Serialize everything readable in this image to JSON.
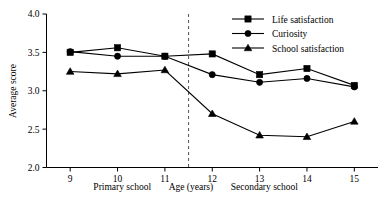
{
  "chart_data": {
    "type": "line",
    "title": "",
    "xlabel": "Age (years)",
    "ylabel": "Average score",
    "x": [
      9,
      10,
      11,
      12,
      13,
      14,
      15
    ],
    "xtick_labels": [
      "9",
      "10",
      "11",
      "12",
      "13",
      "14",
      "15"
    ],
    "ytick_labels": [
      "2.0",
      "2.5",
      "3.0",
      "3.5",
      "4.0"
    ],
    "ytick_values": [
      2.0,
      2.5,
      3.0,
      3.5,
      4.0
    ],
    "xlim": [
      8.5,
      15.5
    ],
    "ylim": [
      2.0,
      4.0
    ],
    "grid": false,
    "legend_position": "top-right",
    "series": [
      {
        "name": "Life satisfaction",
        "marker": "square",
        "values": [
          3.5,
          3.56,
          3.45,
          3.48,
          3.21,
          3.29,
          3.07
        ]
      },
      {
        "name": "Curiosity",
        "marker": "circle",
        "values": [
          3.51,
          3.45,
          3.45,
          3.21,
          3.11,
          3.16,
          3.05
        ]
      },
      {
        "name": "School satisfaction",
        "marker": "triangle",
        "values": [
          3.25,
          3.22,
          3.27,
          2.7,
          2.42,
          2.4,
          2.6
        ]
      }
    ],
    "annotations": {
      "divider_x": 11.5,
      "left_section_label": "Primary school",
      "right_section_label": "Secondary school"
    }
  }
}
